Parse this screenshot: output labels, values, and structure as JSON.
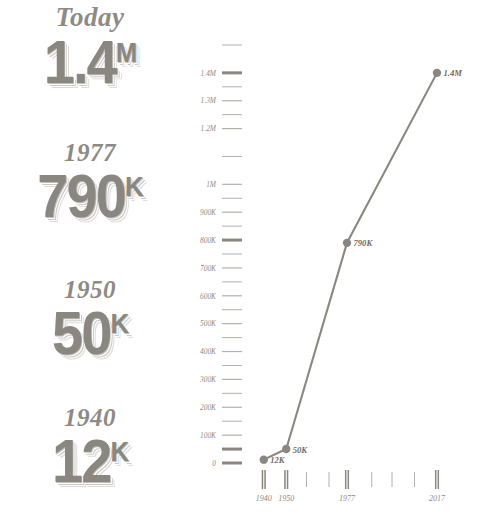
{
  "colors": {
    "ink": "#8a8680",
    "ink_soft": "#b4b0ab",
    "ink_dark": "#6f6b66",
    "background": "#ffffff"
  },
  "stats": [
    {
      "year": "Today",
      "value": "1.4",
      "suffix": "M"
    },
    {
      "year": "1977",
      "value": "790",
      "suffix": "K"
    },
    {
      "year": "1950",
      "value": "50",
      "suffix": "K"
    },
    {
      "year": "1940",
      "value": "12",
      "suffix": "K"
    }
  ],
  "chart_data": {
    "type": "line",
    "title": "",
    "xlabel": "",
    "ylabel": "",
    "x": [
      1940,
      1950,
      1977,
      2017
    ],
    "values": [
      12000,
      50000,
      790000,
      1400000
    ],
    "point_labels": [
      "12K",
      "50K",
      "790K",
      "1.4M"
    ],
    "categories": [
      "1940",
      "1950",
      "1977",
      "2017"
    ],
    "ylim": [
      0,
      1500000
    ],
    "xlim": [
      1933,
      2021
    ],
    "grid": false,
    "legend": null,
    "y_ticks": [
      {
        "value": 1500000,
        "label": "",
        "emphasis": "minor"
      },
      {
        "value": 1400000,
        "label": "1.4M",
        "emphasis": "bold"
      },
      {
        "value": 1350000,
        "label": "",
        "emphasis": "minor"
      },
      {
        "value": 1300000,
        "label": "1.3M",
        "emphasis": "major"
      },
      {
        "value": 1250000,
        "label": "",
        "emphasis": "minor"
      },
      {
        "value": 1200000,
        "label": "1.2M",
        "emphasis": "major"
      },
      {
        "value": 1100000,
        "label": "",
        "emphasis": "minor"
      },
      {
        "value": 1000000,
        "label": "1M",
        "emphasis": "major"
      },
      {
        "value": 950000,
        "label": "",
        "emphasis": "minor"
      },
      {
        "value": 900000,
        "label": "900K",
        "emphasis": "major"
      },
      {
        "value": 850000,
        "label": "",
        "emphasis": "minor"
      },
      {
        "value": 800000,
        "label": "800K",
        "emphasis": "bold"
      },
      {
        "value": 750000,
        "label": "",
        "emphasis": "minor"
      },
      {
        "value": 700000,
        "label": "700K",
        "emphasis": "major"
      },
      {
        "value": 650000,
        "label": "",
        "emphasis": "minor"
      },
      {
        "value": 600000,
        "label": "600K",
        "emphasis": "major"
      },
      {
        "value": 550000,
        "label": "",
        "emphasis": "minor"
      },
      {
        "value": 500000,
        "label": "500K",
        "emphasis": "major"
      },
      {
        "value": 450000,
        "label": "",
        "emphasis": "minor"
      },
      {
        "value": 400000,
        "label": "400K",
        "emphasis": "major"
      },
      {
        "value": 350000,
        "label": "",
        "emphasis": "minor"
      },
      {
        "value": 300000,
        "label": "300K",
        "emphasis": "major"
      },
      {
        "value": 250000,
        "label": "",
        "emphasis": "minor"
      },
      {
        "value": 200000,
        "label": "200K",
        "emphasis": "major"
      },
      {
        "value": 150000,
        "label": "",
        "emphasis": "minor"
      },
      {
        "value": 100000,
        "label": "100K",
        "emphasis": "major"
      },
      {
        "value": 50000,
        "label": "",
        "emphasis": "bold"
      },
      {
        "value": 0,
        "label": "0",
        "emphasis": "bold"
      }
    ],
    "x_ticks": [
      {
        "value": 1940,
        "label": "1940",
        "emphasis": "bold"
      },
      {
        "value": 1950,
        "label": "1950",
        "emphasis": "bold"
      },
      {
        "value": 1959,
        "label": "",
        "emphasis": "minor"
      },
      {
        "value": 1969,
        "label": "",
        "emphasis": "minor"
      },
      {
        "value": 1977,
        "label": "1977",
        "emphasis": "bold"
      },
      {
        "value": 1988,
        "label": "",
        "emphasis": "minor"
      },
      {
        "value": 1997,
        "label": "",
        "emphasis": "minor"
      },
      {
        "value": 2007,
        "label": "",
        "emphasis": "minor"
      },
      {
        "value": 2017,
        "label": "2017",
        "emphasis": "bold"
      }
    ]
  }
}
